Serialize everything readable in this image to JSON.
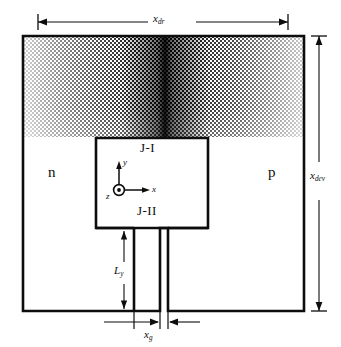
{
  "figure": {
    "type": "semiconductor-device-cross-section",
    "regions": {
      "n_label": "n",
      "p_label": "p"
    },
    "junctions": {
      "upper": "J-I",
      "lower": "J-II"
    },
    "dimensions": {
      "device_width": {
        "symbol": "x",
        "subscript": "dr"
      },
      "device_height": {
        "symbol": "x",
        "subscript": "dev"
      },
      "channel_length": {
        "symbol": "L",
        "subscript": "y"
      },
      "gap_width": {
        "symbol": "x",
        "subscript": "g"
      }
    },
    "axes": {
      "x_label": "x",
      "y_label": "y",
      "z_label": "z",
      "z_glyph": "circle-dot-out-of-page"
    },
    "colors": {
      "line": "#0d0d0d",
      "background": "#ffffff",
      "shading_dark": "#151515",
      "shading_light": "#b9b9b9"
    }
  }
}
